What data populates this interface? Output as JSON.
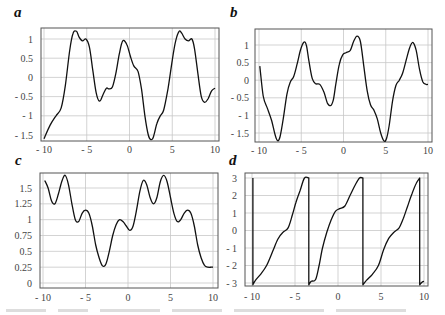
{
  "panels": [
    {
      "label": "a"
    },
    {
      "label": "b"
    },
    {
      "label": "c"
    },
    {
      "label": "d"
    }
  ],
  "chart_data": [
    {
      "type": "line",
      "panel": "a",
      "xlim": [
        -10,
        10
      ],
      "ylim": [
        -1.6,
        1.25
      ],
      "xticks": [
        "- 10",
        "- 5",
        "0",
        "5",
        "10"
      ],
      "xtick_values": [
        -10,
        -5,
        0,
        5,
        10
      ],
      "yticks": [
        "1",
        "0.5",
        "0",
        "- 0.5",
        "- 1",
        "- 1.5"
      ],
      "ytick_values": [
        1,
        0.5,
        0,
        -0.5,
        -1,
        -1.5
      ],
      "grid": true,
      "x": [
        -10,
        -9.3,
        -8.6,
        -8,
        -7.5,
        -7,
        -6.6,
        -6.2,
        -5.9,
        -5.5,
        -5.1,
        -4.7,
        -4.3,
        -3.9,
        -3.5,
        -3.1,
        -2.7,
        -2.4,
        -2.0,
        -1.6,
        -1.2,
        -0.8,
        -0.3,
        0.1,
        0.5,
        1.0,
        1.4,
        1.8,
        2.2,
        2.5,
        2.8,
        3.2,
        3.6,
        4.0,
        4.5,
        5.0,
        5.4,
        5.8,
        6.1,
        6.5,
        6.9,
        7.3,
        7.6,
        8.0,
        8.4,
        8.8,
        9.2,
        9.6,
        10
      ],
      "y": [
        -1.6,
        -1.25,
        -1.0,
        -0.8,
        -0.2,
        0.7,
        1.15,
        1.2,
        1.05,
        0.95,
        1.0,
        0.8,
        0.2,
        -0.4,
        -0.62,
        -0.45,
        -0.28,
        -0.3,
        -0.25,
        0.1,
        0.6,
        0.95,
        0.85,
        0.55,
        0.3,
        0.15,
        -0.3,
        -1.0,
        -1.5,
        -1.62,
        -1.55,
        -1.2,
        -1.0,
        -0.85,
        -0.3,
        0.45,
        0.95,
        1.2,
        1.15,
        1.0,
        0.95,
        1.0,
        0.75,
        0.1,
        -0.5,
        -0.65,
        -0.55,
        -0.35,
        -0.28
      ]
    },
    {
      "type": "line",
      "panel": "b",
      "xlim": [
        -10,
        10
      ],
      "ylim": [
        -1.75,
        1.3
      ],
      "xticks": [
        "- 10",
        "- 5",
        "0",
        "5",
        "10"
      ],
      "xtick_values": [
        -10,
        -5,
        0,
        5,
        10
      ],
      "yticks": [
        "1",
        "0.5",
        "0",
        "- 0.5",
        "- 1",
        "- 1.5"
      ],
      "ytick_values": [
        1,
        0.5,
        0,
        -0.5,
        -1,
        -1.5
      ],
      "grid": true,
      "x": [
        -9.9,
        -9.5,
        -9.0,
        -8.5,
        -8.1,
        -7.8,
        -7.5,
        -7.1,
        -6.7,
        -6.3,
        -5.9,
        -5.5,
        -5.1,
        -4.7,
        -4.4,
        -4.1,
        -3.7,
        -3.3,
        -2.8,
        -2.3,
        -1.9,
        -1.5,
        -1.2,
        -0.9,
        -0.5,
        -0.1,
        0.3,
        0.8,
        1.2,
        1.6,
        2.0,
        2.4,
        2.8,
        3.2,
        3.6,
        4.0,
        4.4,
        4.8,
        5.1,
        5.4,
        5.8,
        6.2,
        6.6,
        7.0,
        7.4,
        7.8,
        8.2,
        8.6,
        9.0,
        9.4,
        9.8,
        10
      ],
      "y": [
        0.4,
        -0.45,
        -0.8,
        -1.15,
        -1.55,
        -1.72,
        -1.6,
        -1.05,
        -0.4,
        -0.05,
        0.1,
        0.45,
        0.85,
        1.08,
        1.0,
        0.55,
        0.05,
        -0.1,
        -0.12,
        -0.35,
        -0.65,
        -0.72,
        -0.55,
        -0.1,
        0.45,
        0.72,
        0.78,
        0.85,
        1.1,
        1.25,
        1.1,
        0.4,
        -0.3,
        -0.7,
        -0.85,
        -1.1,
        -1.5,
        -1.73,
        -1.65,
        -1.3,
        -0.6,
        -0.15,
        0.0,
        0.2,
        0.55,
        0.9,
        1.07,
        0.85,
        0.3,
        -0.05,
        -0.12,
        -0.12
      ]
    },
    {
      "type": "line",
      "panel": "c",
      "xlim": [
        -10,
        10
      ],
      "ylim": [
        0,
        1.75
      ],
      "xticks": [
        "- 10",
        "- 5",
        "0",
        "5",
        "10"
      ],
      "xtick_values": [
        -10,
        -5,
        0,
        5,
        10
      ],
      "yticks": [
        "1.5",
        "1.25",
        "1",
        "0.75",
        "0.5",
        "0.25",
        "0"
      ],
      "ytick_values": [
        1.5,
        1.25,
        1,
        0.75,
        0.5,
        0.25,
        0
      ],
      "grid": true,
      "x": [
        -9.8,
        -9.4,
        -9.0,
        -8.6,
        -8.2,
        -7.8,
        -7.4,
        -7.0,
        -6.6,
        -6.2,
        -5.8,
        -5.4,
        -5.0,
        -4.6,
        -4.2,
        -3.8,
        -3.4,
        -3.0,
        -2.6,
        -2.2,
        -1.8,
        -1.4,
        -1.0,
        -0.6,
        -0.2,
        0.2,
        0.6,
        1.0,
        1.4,
        1.8,
        2.2,
        2.6,
        3.0,
        3.4,
        3.8,
        4.2,
        4.6,
        5.0,
        5.4,
        5.8,
        6.2,
        6.6,
        7.0,
        7.4,
        7.8,
        8.2,
        8.6,
        9.0,
        9.4,
        9.8,
        10
      ],
      "y": [
        1.62,
        1.5,
        1.3,
        1.25,
        1.4,
        1.6,
        1.7,
        1.55,
        1.25,
        1.0,
        0.97,
        1.1,
        1.15,
        1.1,
        0.9,
        0.6,
        0.4,
        0.27,
        0.3,
        0.5,
        0.75,
        0.92,
        1.0,
        0.97,
        0.9,
        0.83,
        0.9,
        1.15,
        1.45,
        1.62,
        1.55,
        1.35,
        1.25,
        1.35,
        1.6,
        1.7,
        1.6,
        1.35,
        1.1,
        0.97,
        1.0,
        1.1,
        1.15,
        1.1,
        0.9,
        0.6,
        0.4,
        0.28,
        0.25,
        0.25,
        0.25
      ]
    },
    {
      "type": "line",
      "panel": "d",
      "xlim": [
        -10.3,
        10.3
      ],
      "ylim": [
        -3.2,
        3.2
      ],
      "xticks": [
        "- 10",
        "- 5",
        "0",
        "5",
        "10"
      ],
      "xtick_values": [
        -10,
        -5,
        0,
        5,
        10
      ],
      "yticks": [
        "3",
        "2",
        "1",
        "0",
        "- 1",
        "- 2",
        "- 3"
      ],
      "ytick_values": [
        3,
        2,
        1,
        0,
        -1,
        -2,
        -3
      ],
      "grid": true,
      "x": [
        -9.9,
        -9.9,
        -9.6,
        -9.0,
        -8.3,
        -7.6,
        -7.0,
        -6.4,
        -5.8,
        -5.3,
        -4.9,
        -4.4,
        -3.9,
        -3.4,
        -3.4,
        -3.1,
        -2.6,
        -2.2,
        -1.8,
        -1.3,
        -0.8,
        -0.3,
        0.2,
        0.8,
        1.4,
        2.0,
        2.5,
        2.9,
        2.9,
        3.3,
        4.0,
        4.7,
        5.3,
        5.9,
        6.5,
        7.1,
        7.6,
        8.1,
        8.6,
        9.1,
        9.5,
        9.5,
        9.8,
        10.0
      ],
      "y": [
        3.0,
        -3.1,
        -2.85,
        -2.5,
        -2.0,
        -1.2,
        -0.5,
        -0.1,
        0.15,
        0.9,
        1.6,
        2.3,
        3.0,
        3.0,
        -3.1,
        -2.9,
        -2.8,
        -2.0,
        -1.0,
        -0.1,
        0.6,
        1.1,
        1.25,
        1.4,
        2.0,
        2.6,
        3.0,
        3.0,
        -3.1,
        -2.85,
        -2.5,
        -2.0,
        -1.1,
        -0.45,
        -0.1,
        0.15,
        0.7,
        1.4,
        2.1,
        2.7,
        3.0,
        -3.1,
        -2.95,
        -2.9
      ]
    }
  ]
}
